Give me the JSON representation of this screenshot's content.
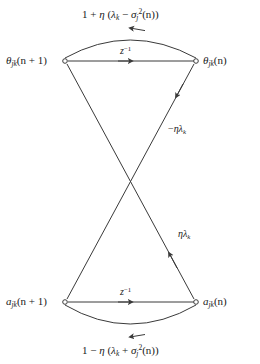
{
  "figure": {
    "type": "signal-flow-graph",
    "background_color": "#ffffff",
    "line_color": "#3a3a3a",
    "nodes": [
      {
        "id": "theta-next",
        "label": "θjk(n + 1)",
        "x": 65,
        "y": 61,
        "position": "top-left"
      },
      {
        "id": "theta-curr",
        "label": "θjk(n)",
        "x": 196,
        "y": 61,
        "position": "top-right"
      },
      {
        "id": "a-next",
        "label": "ajk(n + 1)",
        "x": 65,
        "y": 302,
        "position": "bottom-left"
      },
      {
        "id": "a-curr",
        "label": "ajk(n)",
        "x": 196,
        "y": 302,
        "position": "bottom-right"
      }
    ],
    "edges": [
      {
        "id": "top-arc",
        "from": "theta-curr",
        "to": "theta-next",
        "label": "1 + η (λk − σj²(n))",
        "style": "arc-up"
      },
      {
        "id": "top-delay",
        "from": "theta-next",
        "to": "theta-curr",
        "label": "z⁻¹",
        "style": "straight"
      },
      {
        "id": "bottom-arc",
        "from": "a-curr",
        "to": "a-next",
        "label": "1 − η (λk + σj²(n))",
        "style": "arc-down"
      },
      {
        "id": "bottom-delay",
        "from": "a-next",
        "to": "a-curr",
        "label": "z⁻¹",
        "style": "straight"
      },
      {
        "id": "cross-upper",
        "from": "theta-curr",
        "to": "a-next",
        "label": "−ηλk",
        "style": "diagonal"
      },
      {
        "id": "cross-lower",
        "from": "a-curr",
        "to": "theta-next",
        "label": "ηλk",
        "style": "diagonal"
      }
    ]
  },
  "labels": {
    "theta_next": {
      "base": "θ",
      "sub": "jk",
      "arg": "(n + 1)"
    },
    "theta_curr": {
      "base": "θ",
      "sub": "jk",
      "arg": "(n)"
    },
    "a_next": {
      "base": "a",
      "sub": "jk",
      "arg": "(n + 1)"
    },
    "a_curr": {
      "base": "a",
      "sub": "jk",
      "arg": "(n)"
    },
    "top_arc": {
      "lead": "1 + ",
      "eta": "η",
      "open": " (",
      "lambda": "λ",
      "lambda_sub": "k",
      "op": " − ",
      "sigma": "σ",
      "sigma_sub": "j",
      "sigma_sup": "2",
      "tail": "(n))"
    },
    "bottom_arc": {
      "lead": "1 − ",
      "eta": "η",
      "open": " (",
      "lambda": "λ",
      "lambda_sub": "k",
      "op": " + ",
      "sigma": "σ",
      "sigma_sub": "j",
      "sigma_sup": "2",
      "tail": "(n))"
    },
    "delay": {
      "base": "z",
      "sup": "−1"
    },
    "cross_upper": {
      "sign": "−",
      "eta": "η",
      "lambda": "λ",
      "sub": "k"
    },
    "cross_lower": {
      "sign": "",
      "eta": "η",
      "lambda": "λ",
      "sub": "k"
    }
  }
}
